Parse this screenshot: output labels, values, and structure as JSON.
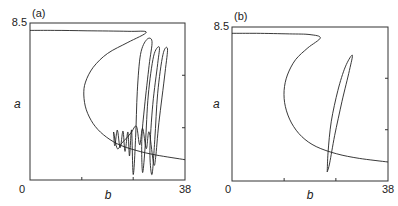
{
  "chart_data": [
    {
      "type": "line",
      "panel_label": "(a)",
      "title": "",
      "xlabel": "b",
      "ylabel": "a",
      "xlim": [
        0,
        38
      ],
      "ylim": [
        0,
        8.5
      ],
      "x_tick_labels": [
        "0",
        "38"
      ],
      "y_tick_labels": [
        "8.5"
      ],
      "x_minor_ticks": [
        12.7,
        25.3
      ],
      "y_minor_ticks": [
        2.83,
        5.67
      ],
      "grid": false,
      "series": [
        {
          "name": "nullcline",
          "points": [
            [
              0,
              8.1
            ],
            [
              6,
              8.1
            ],
            [
              14,
              8.08
            ],
            [
              24,
              8.05
            ],
            [
              28.5,
              8.0
            ],
            [
              24,
              7.45
            ],
            [
              19,
              6.85
            ],
            [
              15.5,
              6.1
            ],
            [
              13.6,
              5.3
            ],
            [
              13.2,
              4.6
            ],
            [
              13.8,
              3.8
            ],
            [
              15.5,
              3.05
            ],
            [
              18,
              2.45
            ],
            [
              21.5,
              1.95
            ],
            [
              26,
              1.6
            ],
            [
              31,
              1.35
            ],
            [
              38,
              1.1
            ]
          ]
        },
        {
          "name": "trajectory",
          "points": [
            [
              20.5,
              2.6
            ],
            [
              20.8,
              1.85
            ],
            [
              21.4,
              2.7
            ],
            [
              22.1,
              1.75
            ],
            [
              22.8,
              2.65
            ],
            [
              23.3,
              1.55
            ],
            [
              24.0,
              2.6
            ],
            [
              24.4,
              1.3
            ],
            [
              24.9,
              2.7
            ],
            [
              25.3,
              0.3
            ],
            [
              25.9,
              2.3
            ],
            [
              26.3,
              4.8
            ],
            [
              27.1,
              6.8
            ],
            [
              28.6,
              7.6
            ],
            [
              29.9,
              7.5
            ],
            [
              29.2,
              6.2
            ],
            [
              28.1,
              4.0
            ],
            [
              27.4,
              2.2
            ],
            [
              27.6,
              0.4
            ],
            [
              28.3,
              2.0
            ],
            [
              29.0,
              4.6
            ],
            [
              30.3,
              6.7
            ],
            [
              31.7,
              7.2
            ],
            [
              31.3,
              6.3
            ],
            [
              30.1,
              4.1
            ],
            [
              29.4,
              1.6
            ],
            [
              29.9,
              0.3
            ],
            [
              30.6,
              2.2
            ],
            [
              31.3,
              4.7
            ],
            [
              32.6,
              6.8
            ],
            [
              33.7,
              7.1
            ],
            [
              33.1,
              5.8
            ],
            [
              31.6,
              3.1
            ],
            [
              30.8,
              1.2
            ],
            [
              30.3,
              0.9
            ],
            [
              29.2,
              2.6
            ],
            [
              28.5,
              1.7
            ],
            [
              27.6,
              2.8
            ],
            [
              26.9,
              1.9
            ],
            [
              26.1,
              2.9
            ],
            [
              24.9,
              2.6
            ],
            [
              23.8,
              2.3
            ],
            [
              22.5,
              2.0
            ],
            [
              21.4,
              1.7
            ],
            [
              20.5,
              2.6
            ]
          ]
        }
      ]
    },
    {
      "type": "line",
      "panel_label": "(b)",
      "title": "",
      "xlabel": "b",
      "ylabel": "a",
      "xlim": [
        0,
        38
      ],
      "ylim": [
        0,
        8.5
      ],
      "x_tick_labels": [
        "0",
        "38"
      ],
      "y_tick_labels": [
        "8.5"
      ],
      "x_minor_ticks": [
        12.7,
        25.3
      ],
      "y_minor_ticks": [
        2.83,
        5.67
      ],
      "grid": false,
      "series": [
        {
          "name": "nullcline",
          "points": [
            [
              0,
              8.15
            ],
            [
              6,
              8.15
            ],
            [
              14,
              8.12
            ],
            [
              19,
              8.08
            ],
            [
              21.5,
              7.9
            ],
            [
              18.5,
              7.35
            ],
            [
              15.5,
              6.7
            ],
            [
              13.5,
              5.85
            ],
            [
              12.7,
              5.0
            ],
            [
              13.0,
              4.1
            ],
            [
              14.5,
              3.2
            ],
            [
              17.0,
              2.45
            ],
            [
              20.5,
              1.9
            ],
            [
              25.5,
              1.5
            ],
            [
              31,
              1.25
            ],
            [
              38,
              1.05
            ]
          ]
        },
        {
          "name": "trajectory",
          "points": [
            [
              23.2,
              0.5
            ],
            [
              23.4,
              1.6
            ],
            [
              24.2,
              3.3
            ],
            [
              25.8,
              5.0
            ],
            [
              27.6,
              6.3
            ],
            [
              29.3,
              6.95
            ],
            [
              28.6,
              6.1
            ],
            [
              26.8,
              4.4
            ],
            [
              25.0,
              2.5
            ],
            [
              23.8,
              1.0
            ],
            [
              23.2,
              0.5
            ]
          ]
        }
      ]
    }
  ]
}
